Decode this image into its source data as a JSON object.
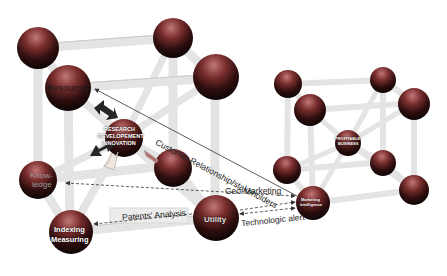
{
  "diagram": {
    "title": "",
    "colors": {
      "sphere_top": "#b06a6a",
      "sphere_mid": "#5a1d1d",
      "sphere_bottom": "#1a0a0a",
      "beam": "#e6e6e6",
      "beam_edge": "#c8c8c8",
      "arrow_dark": "#2a2a2a",
      "label_box": "#ececec"
    },
    "left_cube": {
      "nodes": {
        "resources": "Resources",
        "center_line1": "RESEARCH",
        "center_line2": "DEVELOPEMENT",
        "center_line3": "INNOVATION",
        "knowledge_line1": "Know-",
        "knowledge_line2": "ledge",
        "indexing_line1": "Indexing",
        "indexing_line2": "Measuring",
        "utility": "Utility"
      }
    },
    "right_cube": {
      "nodes": {
        "center_line1": "PROFITABLE",
        "center_line2": "BUSINESS",
        "marketing_line1": "Marketing",
        "marketing_line2": "intelligence"
      }
    },
    "edges": {
      "customer_relationship": "Customer Relationship/stakeholders",
      "geo_marketing": "Geo-Marketing",
      "patents_analysis": "Patents' Analysis",
      "technologic_alert": "Technologic alert"
    }
  }
}
